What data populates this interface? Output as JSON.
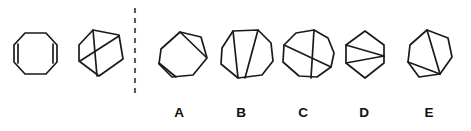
{
  "figure": {
    "type": "visual-analogy-puzzle",
    "stroke_color": "#1a1a1a",
    "divider_color": "#5a5a5a",
    "background_color": "#ffffff",
    "divider": {
      "name": "dashed-vertical-divider",
      "x": 135,
      "y_start": 8,
      "y_end": 96,
      "dash": "5 5"
    },
    "prompt_shapes": [
      {
        "id": "prompt-1",
        "name": "octagon-with-two-vertical-chords",
        "sides": 8,
        "chord_count": 2,
        "outline": "14,45 25,33 46,33 57,45 57,62 46,74 25,74 14,62",
        "chords": [
          "18,44 18,63",
          "53,44 53,63"
        ]
      },
      {
        "id": "prompt-2",
        "name": "rotated-pentagon-with-two-chords",
        "sides": 5,
        "chord_count": 2,
        "outline": "79,45 93,30 119,35 123,59 99,76 79,61",
        "chords": [
          "93,30 97,76",
          "80,61 119,36"
        ]
      }
    ],
    "options": [
      {
        "letter": "A",
        "name": "option-a-heptagon",
        "sides": 7,
        "chord_count": 2,
        "label_x": 179,
        "label_y": 117,
        "outline": "161,49 180,32 201,37 207,58 193,75 172,77 159,64",
        "chords": [
          "180,32 206,57",
          "159,63 176,77"
        ]
      },
      {
        "letter": "B",
        "name": "option-b-octagon",
        "sides": 8,
        "chord_count": 2,
        "label_x": 241,
        "label_y": 117,
        "outline": "222,48 233,31 258,30 271,43 273,61 262,75 238,78 221,64",
        "chords": [
          "233,31 238,78",
          "258,30 245,78"
        ]
      },
      {
        "letter": "C",
        "name": "option-c-nonagon",
        "sides": 9,
        "chord_count": 2,
        "label_x": 303,
        "label_y": 117,
        "outline": "284,45 296,33 314,30 328,38 334,53 331,67 317,77 299,76 283,62",
        "chords": [
          "284,45 331,67",
          "314,30 311,78"
        ]
      },
      {
        "letter": "D",
        "name": "option-d-hexagon",
        "sides": 6,
        "chord_count": 2,
        "label_x": 364,
        "label_y": 117,
        "outline": "346,45 365,31 384,45 384,63 365,78 346,63",
        "chords": [
          "346,45 384,56",
          "346,63 384,56"
        ]
      },
      {
        "letter": "E",
        "name": "option-e-heptagon",
        "sides": 7,
        "chord_count": 2,
        "label_x": 429,
        "label_y": 117,
        "outline": "410,45 427,30 448,38 452,57 440,74 419,77 408,62",
        "chords": [
          "427,30 440,74",
          "408,62 440,74"
        ]
      }
    ]
  }
}
